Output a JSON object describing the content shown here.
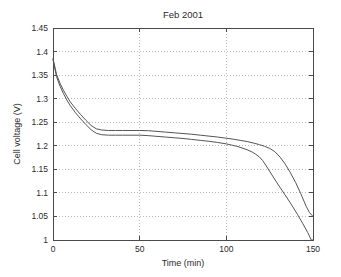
{
  "chart_data": {
    "type": "line",
    "title": "Feb 2001",
    "xlabel": "Time (min)",
    "ylabel": "Cell voltage (V)",
    "xlim": [
      0,
      150
    ],
    "ylim": [
      1,
      1.45
    ],
    "grid": true,
    "legend": "none",
    "xticks": [
      0,
      50,
      100,
      150
    ],
    "xtick_labels": [
      "0",
      "50",
      "100",
      "150"
    ],
    "yticks": [
      1,
      1.05,
      1.1,
      1.15,
      1.2,
      1.25,
      1.3,
      1.35,
      1.4,
      1.45
    ],
    "ytick_labels": [
      "1",
      "1.05",
      "1.1",
      "1.15",
      "1.2",
      "1.25",
      "1.3",
      "1.35",
      "1.4",
      "1.45"
    ],
    "series": [
      {
        "name": "cell-1",
        "color": "#555555",
        "x": [
          0,
          2,
          4,
          6,
          8,
          10,
          13,
          16,
          19,
          22,
          25,
          28,
          32,
          36,
          40,
          45,
          50,
          55,
          60,
          65,
          70,
          75,
          80,
          85,
          90,
          95,
          100,
          104,
          108,
          112,
          116,
          119,
          122,
          125,
          128,
          131,
          134,
          137,
          140,
          143,
          146,
          148,
          150
        ],
        "y": [
          1.385,
          1.352,
          1.333,
          1.318,
          1.305,
          1.293,
          1.279,
          1.266,
          1.254,
          1.243,
          1.236,
          1.2335,
          1.2325,
          1.2325,
          1.2325,
          1.2325,
          1.2325,
          1.232,
          1.2305,
          1.229,
          1.2275,
          1.226,
          1.2245,
          1.2225,
          1.2205,
          1.2185,
          1.216,
          1.214,
          1.2115,
          1.209,
          1.2055,
          1.2025,
          1.199,
          1.1945,
          1.1875,
          1.176,
          1.161,
          1.1425,
          1.122,
          1.098,
          1.072,
          1.058,
          1.05
        ]
      },
      {
        "name": "cell-2",
        "color": "#555555",
        "x": [
          0,
          2,
          4,
          6,
          8,
          10,
          13,
          16,
          19,
          22,
          25,
          28,
          32,
          36,
          40,
          45,
          50,
          55,
          60,
          65,
          70,
          75,
          80,
          85,
          90,
          95,
          100,
          103,
          106,
          109,
          112,
          115,
          117,
          119,
          121,
          123,
          126,
          129,
          132,
          135,
          138,
          141,
          144,
          147,
          149,
          150
        ],
        "y": [
          1.383,
          1.347,
          1.327,
          1.311,
          1.297,
          1.285,
          1.27,
          1.257,
          1.245,
          1.234,
          1.2265,
          1.2235,
          1.2225,
          1.2225,
          1.2225,
          1.2225,
          1.2225,
          1.2215,
          1.22,
          1.2185,
          1.217,
          1.2155,
          1.2135,
          1.2115,
          1.2095,
          1.207,
          1.204,
          1.2015,
          1.199,
          1.1955,
          1.1915,
          1.1865,
          1.182,
          1.1765,
          1.1685,
          1.1575,
          1.14,
          1.1225,
          1.106,
          1.0895,
          1.0725,
          1.0545,
          1.0355,
          1.0155,
          1.0,
          1.0
        ]
      }
    ]
  },
  "plot_geometry": {
    "left": 53,
    "top": 28,
    "right": 313,
    "bottom": 240
  }
}
